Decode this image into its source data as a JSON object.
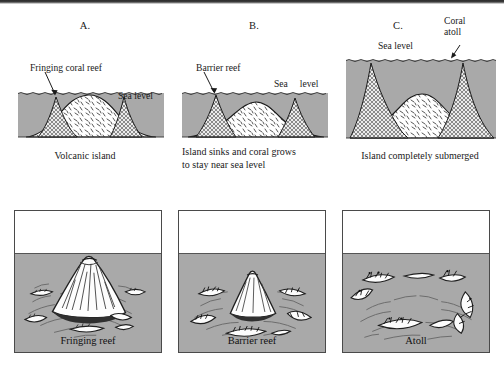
{
  "figure": {
    "colors": {
      "water": "#a9a9a9",
      "island_fill": "#ffffff",
      "reef_fill": "#e8e8e8",
      "outline": "#1a1a1a",
      "box_border": "#4a4a4a",
      "text": "#1a1a1a"
    }
  },
  "cross_sections": [
    {
      "letter": "A.",
      "callout_label": "Fringing coral reef",
      "sea_level_label": "Sea level",
      "caption": "Volcanic island"
    },
    {
      "letter": "B.",
      "callout_label": "Barrier reef",
      "sea_level_label": "Sea     level",
      "caption": "Island sinks and coral grows\nto stay near sea level"
    },
    {
      "letter": "C.",
      "callout_label": "Coral\natoll",
      "sea_level_label": "Sea level",
      "caption": "Island completely submerged"
    }
  ],
  "illustrations": [
    {
      "caption": "Fringing reef"
    },
    {
      "caption": "Barrier reef"
    },
    {
      "caption": "Atoll"
    }
  ]
}
